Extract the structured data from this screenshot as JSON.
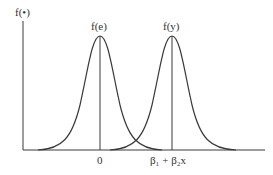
{
  "diagram": {
    "type": "two normal density curves",
    "y_axis_label": "f(•)",
    "curves": [
      {
        "label": "f(e)",
        "center_label": "0"
      },
      {
        "label": "f(y)",
        "center_label": "β₁ + β₂x"
      }
    ],
    "x_tick_labels": [
      "0",
      "β₁ + β₂x"
    ],
    "colors": {
      "line": "#3a3a3a",
      "text": "#333333",
      "background": "#ffffff"
    }
  }
}
